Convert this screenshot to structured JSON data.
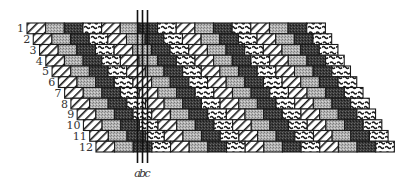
{
  "diagram": {
    "type": "staggered-brick-pattern",
    "row_labels": [
      "1",
      "2",
      "3",
      "4",
      "5",
      "6",
      "7",
      "8",
      "9",
      "10",
      "11",
      "12"
    ],
    "cell_sequence": [
      "hatch",
      "gray",
      "dark",
      "wave"
    ],
    "repeats_per_row": 4,
    "cell_styles": {
      "hatch": {
        "fill": "#ffffff",
        "texture": "diagonal-lines"
      },
      "gray": {
        "fill": "#a9a9a9",
        "texture": "stipple"
      },
      "dark": {
        "fill": "#3c3c3c",
        "texture": "stipple"
      },
      "wave": {
        "fill": "#ffffff",
        "texture": "s-strokes"
      }
    },
    "marker_lines": [
      {
        "label": "a"
      },
      {
        "label": "b"
      },
      {
        "label": "c"
      }
    ],
    "colors": {
      "outline": "#1a1a1a",
      "text": "#333333"
    }
  }
}
